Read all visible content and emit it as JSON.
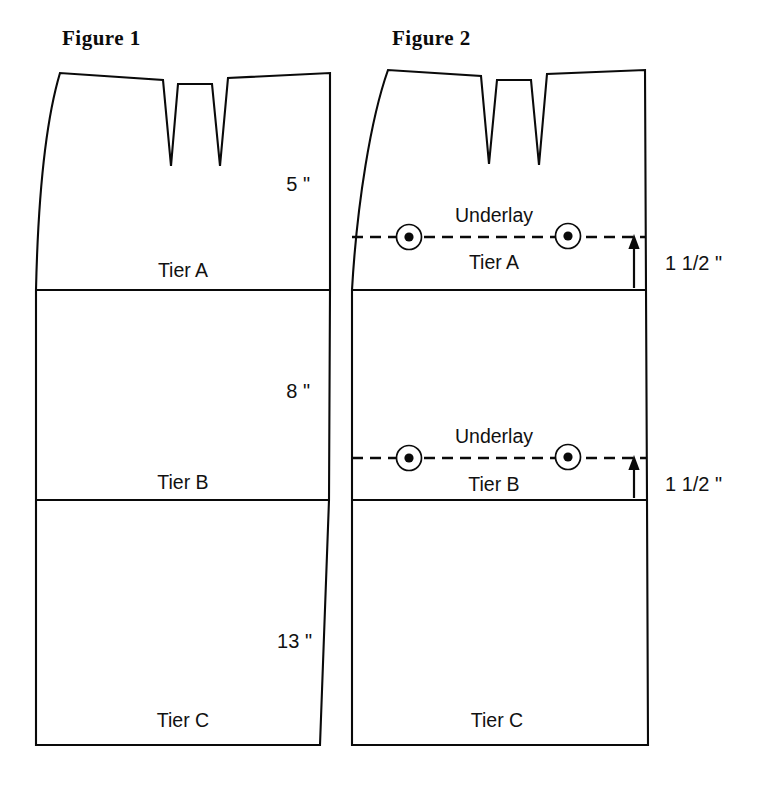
{
  "figures": [
    {
      "id": "figure-1",
      "title": "Figure 1",
      "tiers": [
        {
          "name": "Tier A",
          "measurement": "5 \""
        },
        {
          "name": "Tier B",
          "measurement": "8 \""
        },
        {
          "name": "Tier C",
          "measurement": "13 \""
        }
      ]
    },
    {
      "id": "figure-2",
      "title": "Figure 2",
      "tiers": [
        {
          "name": "Tier A",
          "underlay_label": "Underlay",
          "offset": "1 1/2 \""
        },
        {
          "name": "Tier B",
          "underlay_label": "Underlay",
          "offset": "1 1/2 \""
        },
        {
          "name": "Tier C"
        }
      ]
    }
  ],
  "icons": {
    "snap_marker": "snap-button-icon",
    "offset_arrow": "up-arrow-icon"
  },
  "colors": {
    "line": "#0a0a0a",
    "background": "#ffffff",
    "text": "#111111"
  }
}
